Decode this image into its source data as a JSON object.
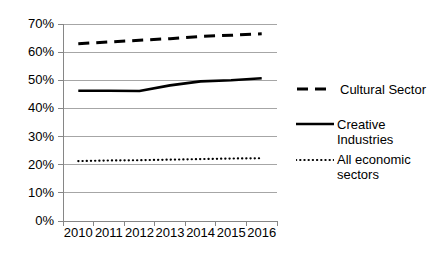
{
  "chart_data": {
    "type": "line",
    "title": "",
    "subtitle": "",
    "xlabel": "",
    "ylabel": "",
    "x": [
      "2010",
      "2011",
      "2012",
      "2013",
      "2014",
      "2015",
      "2016"
    ],
    "categories": [
      "2010",
      "2011",
      "2012",
      "2013",
      "2014",
      "2015",
      "2016"
    ],
    "ylim": [
      0,
      70
    ],
    "ytick_values": [
      0,
      10,
      20,
      30,
      40,
      50,
      60,
      70
    ],
    "ytick_labels": [
      "0%",
      "10%",
      "20%",
      "30%",
      "40%",
      "50%",
      "60%",
      "70%"
    ],
    "xtick_labels": [
      "2010",
      "2011",
      "2012",
      "2013",
      "2014",
      "2015",
      "2016"
    ],
    "grid": "horizontal",
    "legend_position": "right",
    "series": [
      {
        "name": "Cultural Sector",
        "style": "dashed",
        "color": "#000000",
        "values": [
          63.0,
          63.6,
          64.2,
          64.8,
          65.6,
          66.0,
          66.5
        ]
      },
      {
        "name": "Creative Industries",
        "style": "solid",
        "color": "#000000",
        "values": [
          46.3,
          46.3,
          46.2,
          48.2,
          49.6,
          50.0,
          50.7
        ]
      },
      {
        "name": "All economic sectors",
        "style": "dotted",
        "color": "#000000",
        "values": [
          21.3,
          21.5,
          21.6,
          21.8,
          22.0,
          22.2,
          22.3
        ]
      }
    ]
  },
  "legend": {
    "items": [
      {
        "label": "Cultural Sector",
        "marker": "dashed-line-marker"
      },
      {
        "label": "Creative\nIndustries",
        "marker": "solid-line-marker"
      },
      {
        "label": "All economic\nsectors",
        "marker": "dotted-line-marker"
      }
    ]
  },
  "axes": {
    "y_labels": [
      "70%",
      "60%",
      "50%",
      "40%",
      "30%",
      "20%",
      "10%",
      "0%"
    ],
    "x_labels": [
      "2010",
      "2011",
      "2012",
      "2013",
      "2014",
      "2015",
      "2016"
    ]
  },
  "colors": {
    "ink": "#000000",
    "gridline": "#a6a6a6",
    "axis": "#868686",
    "background": "#ffffff"
  }
}
